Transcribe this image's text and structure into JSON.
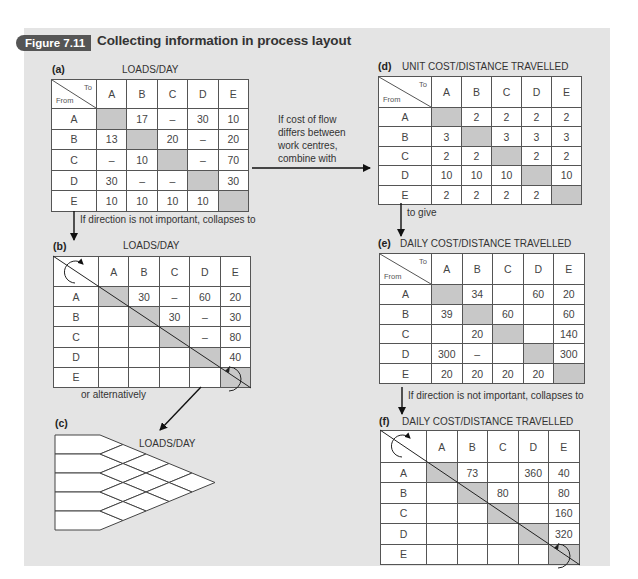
{
  "figure": {
    "badge": "Figure 7.11",
    "title": "Collecting information in process layout"
  },
  "headers": [
    "A",
    "B",
    "C",
    "D",
    "E"
  ],
  "corner": {
    "to": "To",
    "from": "From"
  },
  "panels": {
    "a": {
      "label": "(a)",
      "title": "LOADS/DAY",
      "rows": [
        {
          "row": "A",
          "cells": [
            "",
            "17",
            "–",
            "30",
            "10"
          ]
        },
        {
          "row": "B",
          "cells": [
            "13",
            "",
            "20",
            "–",
            "20"
          ]
        },
        {
          "row": "C",
          "cells": [
            "–",
            "10",
            "",
            "–",
            "70"
          ]
        },
        {
          "row": "D",
          "cells": [
            "30",
            "–",
            "–",
            "",
            "30"
          ]
        },
        {
          "row": "E",
          "cells": [
            "10",
            "10",
            "10",
            "10",
            ""
          ]
        }
      ]
    },
    "b": {
      "label": "(b)",
      "title": "LOADS/DAY",
      "rows": [
        {
          "row": "A",
          "cells": [
            "",
            "30",
            "–",
            "60",
            "20"
          ]
        },
        {
          "row": "B",
          "cells": [
            "",
            "",
            "30",
            "–",
            "30"
          ]
        },
        {
          "row": "C",
          "cells": [
            "",
            "",
            "",
            "–",
            "80"
          ]
        },
        {
          "row": "D",
          "cells": [
            "",
            "",
            "",
            "",
            "40"
          ]
        },
        {
          "row": "E",
          "cells": [
            "",
            "",
            "",
            "",
            ""
          ]
        }
      ]
    },
    "c": {
      "label": "(c)",
      "title": "LOADS/DAY",
      "rows": [
        "A",
        "B",
        "C",
        "D",
        "E"
      ],
      "pairs": {
        "AB": "30",
        "BC": "30",
        "CD": "–",
        "DE": "40",
        "AC": "–",
        "BD": "–",
        "CE": "80",
        "AD": "60",
        "BE": "30",
        "AE": "20"
      }
    },
    "d": {
      "label": "(d)",
      "title": "UNIT COST/DISTANCE TRAVELLED",
      "rows": [
        {
          "row": "A",
          "cells": [
            "",
            "2",
            "2",
            "2",
            "2"
          ]
        },
        {
          "row": "B",
          "cells": [
            "3",
            "",
            "3",
            "3",
            "3"
          ]
        },
        {
          "row": "C",
          "cells": [
            "2",
            "2",
            "",
            "2",
            "2"
          ]
        },
        {
          "row": "D",
          "cells": [
            "10",
            "10",
            "10",
            "",
            "10"
          ]
        },
        {
          "row": "E",
          "cells": [
            "2",
            "2",
            "2",
            "2",
            ""
          ]
        }
      ]
    },
    "e": {
      "label": "(e)",
      "title": "DAILY COST/DISTANCE TRAVELLED",
      "rows": [
        {
          "row": "A",
          "cells": [
            "",
            "34",
            "",
            "60",
            "20"
          ]
        },
        {
          "row": "B",
          "cells": [
            "39",
            "",
            "60",
            "",
            "60"
          ]
        },
        {
          "row": "C",
          "cells": [
            "",
            "20",
            "",
            "",
            "140"
          ]
        },
        {
          "row": "D",
          "cells": [
            "300",
            "–",
            "",
            "",
            "300"
          ]
        },
        {
          "row": "E",
          "cells": [
            "20",
            "20",
            "20",
            "20",
            ""
          ]
        }
      ]
    },
    "f": {
      "label": "(f)",
      "title": "DAILY COST/DISTANCE TRAVELLED",
      "rows": [
        {
          "row": "A",
          "cells": [
            "",
            "73",
            "",
            "360",
            "40"
          ]
        },
        {
          "row": "B",
          "cells": [
            "",
            "",
            "80",
            "",
            "80"
          ]
        },
        {
          "row": "C",
          "cells": [
            "",
            "",
            "",
            "",
            "160"
          ]
        },
        {
          "row": "D",
          "cells": [
            "",
            "",
            "",
            "",
            "320"
          ]
        },
        {
          "row": "E",
          "cells": [
            "",
            "",
            "",
            "",
            ""
          ]
        }
      ]
    }
  },
  "annotations": {
    "a_to_b": "If direction is not important, collapses to",
    "a_to_d": [
      "If cost of flow",
      "differs between",
      "work centres,",
      "combine with"
    ],
    "d_to_e": "to give",
    "e_to_f": "If direction is not important, collapses to",
    "b_to_c": "or alternatively"
  },
  "colors": {
    "panel_bg": "#e4e4e4",
    "badge_bg": "#555555",
    "diagonal_shade": "#c8c8c8",
    "grid_line": "#555555"
  }
}
